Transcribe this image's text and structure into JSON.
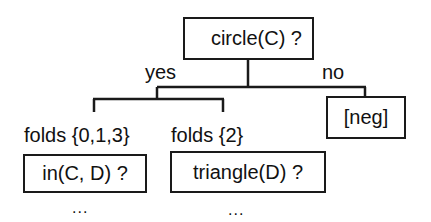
{
  "tree": {
    "root": {
      "label": "circle(C) ?"
    },
    "branches": {
      "yes": "yes",
      "no": "no"
    },
    "yes_children": [
      {
        "fold_label": "folds {0,1,3}",
        "node_label": "in(C, D) ?",
        "continuation": "..."
      },
      {
        "fold_label": "folds {2}",
        "node_label": "triangle(D) ?",
        "continuation": "..."
      }
    ],
    "no_child": {
      "label": "[neg]"
    }
  }
}
